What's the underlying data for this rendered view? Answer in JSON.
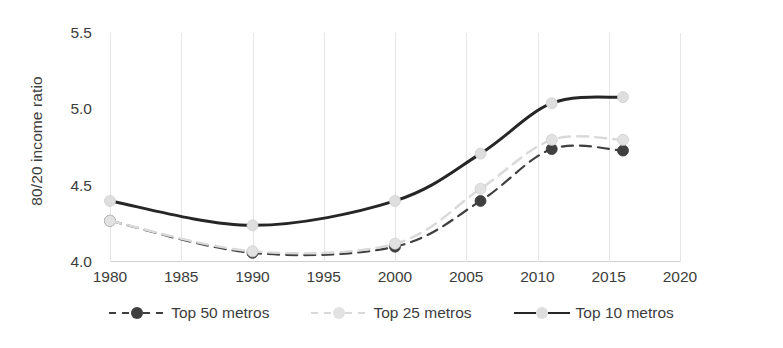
{
  "chart_data": {
    "type": "line",
    "title": "",
    "xlabel": "",
    "ylabel": "80/20 income ratio",
    "xlim": [
      1980,
      2020
    ],
    "ylim": [
      4.0,
      5.5
    ],
    "yticks": [
      "4.0",
      "4.5",
      "5.0",
      "5.5"
    ],
    "ytick_values": [
      4.0,
      4.5,
      5.0,
      5.5
    ],
    "xticks": [
      "1980",
      "1985",
      "1990",
      "1995",
      "2000",
      "2005",
      "2010",
      "2015",
      "2020"
    ],
    "xtick_values": [
      1980,
      1985,
      1990,
      1995,
      2000,
      2005,
      2010,
      2015,
      2020
    ],
    "grid": "vertical",
    "legend_position": "bottom",
    "x": [
      1980,
      1990,
      2000,
      2006,
      2011,
      2016
    ],
    "series": [
      {
        "name": "Top 50 metros",
        "values": [
          4.27,
          4.06,
          4.1,
          4.4,
          4.74,
          4.73
        ],
        "color": "#3f3f3f",
        "marker_color": "#3f3f3f",
        "line_style": "dashed",
        "line_width": 2.2,
        "marker_size": 11
      },
      {
        "name": "Top 25 metros",
        "values": [
          4.27,
          4.07,
          4.12,
          4.48,
          4.8,
          4.8
        ],
        "color": "#d9d9d9",
        "marker_color": "#e2e2e2",
        "line_style": "dashed",
        "line_width": 2.4,
        "marker_size": 11
      },
      {
        "name": "Top 10 metros",
        "values": [
          4.4,
          4.24,
          4.4,
          4.71,
          5.04,
          5.08
        ],
        "color": "#262626",
        "marker_color": "#dedede",
        "line_style": "solid",
        "line_width": 3.0,
        "marker_size": 11
      }
    ]
  },
  "legend": {
    "items": [
      {
        "label": "Top 50 metros"
      },
      {
        "label": "Top 25 metros"
      },
      {
        "label": "Top 10 metros"
      }
    ]
  },
  "axis": {
    "y_title": "80/20 income ratio"
  }
}
